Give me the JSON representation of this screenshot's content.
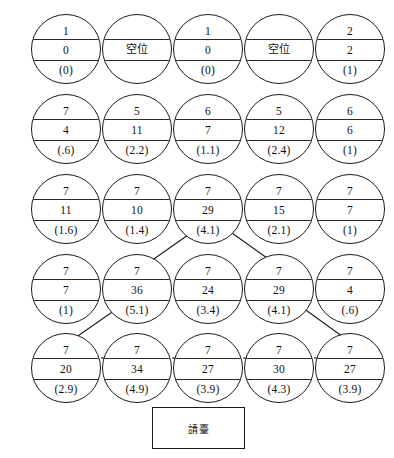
{
  "diagram": {
    "type": "node-grid",
    "rows": 5,
    "cols": 5,
    "node_shape": "circle-three-band",
    "line_color": "#1a1a1a",
    "background_color": "#ffffff",
    "grid": [
      [
        {
          "top": "1",
          "mid": "0",
          "bottom": "(0)",
          "empty": false
        },
        {
          "top": "",
          "mid": "空位",
          "bottom": "",
          "empty": true
        },
        {
          "top": "1",
          "mid": "0",
          "bottom": "(0)",
          "empty": false
        },
        {
          "top": "",
          "mid": "空位",
          "bottom": "",
          "empty": true
        },
        {
          "top": "2",
          "mid": "2",
          "bottom": "(1)",
          "empty": false
        }
      ],
      [
        {
          "top": "7",
          "mid": "4",
          "bottom": "(.6)",
          "empty": false
        },
        {
          "top": "5",
          "mid": "11",
          "bottom": "(2.2)",
          "empty": false
        },
        {
          "top": "6",
          "mid": "7",
          "bottom": "(1.1)",
          "empty": false
        },
        {
          "top": "5",
          "mid": "12",
          "bottom": "(2.4)",
          "empty": false
        },
        {
          "top": "6",
          "mid": "6",
          "bottom": "(1)",
          "empty": false
        }
      ],
      [
        {
          "top": "7",
          "mid": "11",
          "bottom": "(1.6)",
          "empty": false
        },
        {
          "top": "7",
          "mid": "10",
          "bottom": "(1.4)",
          "empty": false
        },
        {
          "top": "7",
          "mid": "29",
          "bottom": "(4.1)",
          "empty": false
        },
        {
          "top": "7",
          "mid": "15",
          "bottom": "(2.1)",
          "empty": false
        },
        {
          "top": "7",
          "mid": "7",
          "bottom": "(1)",
          "empty": false
        }
      ],
      [
        {
          "top": "7",
          "mid": "7",
          "bottom": "(1)",
          "empty": false
        },
        {
          "top": "7",
          "mid": "36",
          "bottom": "(5.1)",
          "empty": false
        },
        {
          "top": "7",
          "mid": "24",
          "bottom": "(3.4)",
          "empty": false
        },
        {
          "top": "7",
          "mid": "29",
          "bottom": "(4.1)",
          "empty": false
        },
        {
          "top": "7",
          "mid": "4",
          "bottom": "(.6)",
          "empty": false
        }
      ],
      [
        {
          "top": "7",
          "mid": "20",
          "bottom": "(2.9)",
          "empty": false
        },
        {
          "top": "7",
          "mid": "34",
          "bottom": "(4.9)",
          "empty": false
        },
        {
          "top": "7",
          "mid": "27",
          "bottom": "(3.9)",
          "empty": false
        },
        {
          "top": "7",
          "mid": "30",
          "bottom": "(4.3)",
          "empty": false
        },
        {
          "top": "7",
          "mid": "27",
          "bottom": "(3.9)",
          "empty": false
        }
      ]
    ],
    "connections": [
      {
        "from": "r3c3",
        "to": "r4c2",
        "style": "diagonal"
      },
      {
        "from": "r3c3",
        "to": "r4c4",
        "style": "diagonal"
      },
      {
        "from": "r4c2",
        "to": "r5c1",
        "style": "diagonal"
      },
      {
        "from": "r4c4",
        "to": "r5c5",
        "style": "diagonal"
      },
      {
        "from": "r5c1",
        "to": "r5c2",
        "style": "horizontal"
      },
      {
        "from": "r5c2",
        "to": "r5c3",
        "style": "horizontal"
      },
      {
        "from": "r5c3",
        "to": "r5c4",
        "style": "horizontal"
      },
      {
        "from": "r5c4",
        "to": "r5c5",
        "style": "horizontal"
      }
    ]
  },
  "footer": {
    "box_label": "請臺"
  }
}
